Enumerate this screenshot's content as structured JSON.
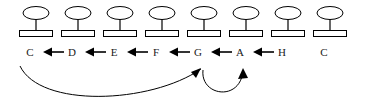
{
  "figure": {
    "width": 371,
    "height": 108,
    "background_color": "#ffffff",
    "stroke_color": "#000000",
    "text_color": "#1a1a1a",
    "icon_fill_color": "#ffffff"
  },
  "nodes": [
    {
      "id": "n1",
      "label": "C",
      "icon": "table-node-icon",
      "x": 36
    },
    {
      "id": "n2",
      "label": "D",
      "icon": "table-node-icon",
      "x": 78
    },
    {
      "id": "n3",
      "label": "E",
      "icon": "table-node-icon",
      "x": 120
    },
    {
      "id": "n4",
      "label": "F",
      "icon": "table-node-icon",
      "x": 162
    },
    {
      "id": "n5",
      "label": "G",
      "icon": "table-node-icon",
      "x": 204
    },
    {
      "id": "n6",
      "label": "A",
      "icon": "table-node-icon",
      "x": 246
    },
    {
      "id": "n7",
      "label": "H",
      "icon": "table-node-icon",
      "x": 288
    },
    {
      "id": "n8",
      "label": "C",
      "icon": "table-node-icon",
      "x": 330
    }
  ],
  "inline_arrows": [
    {
      "id": "a1",
      "icon": "arrow-left-icon",
      "from": "D",
      "to": "C",
      "x": 42
    },
    {
      "id": "a2",
      "icon": "arrow-left-icon",
      "from": "E",
      "to": "D",
      "x": 84
    },
    {
      "id": "a3",
      "icon": "arrow-left-icon",
      "from": "F",
      "to": "E",
      "x": 126
    },
    {
      "id": "a4",
      "icon": "arrow-left-icon",
      "from": "G",
      "to": "F",
      "x": 168
    },
    {
      "id": "a5",
      "icon": "arrow-left-icon",
      "from": "A",
      "to": "G",
      "x": 210
    },
    {
      "id": "a6",
      "icon": "arrow-left-icon",
      "from": "H",
      "to": "A",
      "x": 252
    }
  ],
  "curved_arrows": [
    {
      "id": "curve-long",
      "icon": "curved-arrow-icon",
      "from": "C",
      "to": "G",
      "path": "M 20 66 C 40 108, 150 104, 201 69",
      "head_points": "201,68 191,72 196,78",
      "head_rotation": -35
    },
    {
      "id": "curve-short",
      "icon": "curved-arrow-icon",
      "from": "G",
      "to": "A",
      "path": "M 203 70 C 200 96, 240 102, 243 71",
      "head_points": "243,68 238,79 248,78",
      "head_rotation": 10
    }
  ]
}
